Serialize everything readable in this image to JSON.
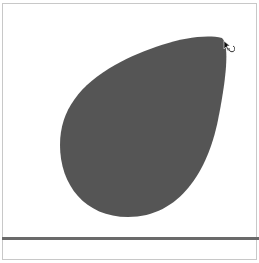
{
  "canvas": {
    "background": "#ffffff",
    "frame_border_color": "#c8c8c8"
  },
  "shape": {
    "type": "teardrop",
    "fill": "#555555",
    "tip": [
      222,
      38
    ],
    "orientation": "tip pointing upper-right"
  },
  "baseline": {
    "color": "#6a6a6a",
    "y": 238
  },
  "cursor": {
    "icon": "rotate-cursor-icon",
    "position": [
      226,
      45
    ]
  }
}
